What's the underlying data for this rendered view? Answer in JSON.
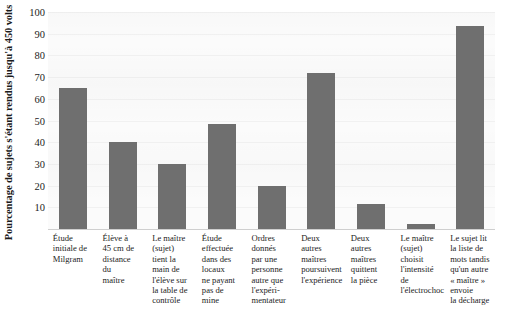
{
  "chart_data": {
    "type": "bar",
    "title": "",
    "subtitle": "",
    "xlabel": "",
    "ylabel": "Pourcentage de sujets s'étant rendus jusqu'à 450 volts",
    "ylim": [
      0,
      100
    ],
    "yticks": [
      10,
      20,
      30,
      40,
      50,
      60,
      70,
      80,
      90,
      100
    ],
    "grid": "horizontal",
    "legend": "none",
    "bar_color": "#6f6f6f",
    "plot_background": "#fbfbfb",
    "categories": [
      "Étude initiale de Milgram",
      "Élève à 45 cm de distance du maître",
      "Le maître (sujet) tient la main de l'élève sur la table de contrôle",
      "Étude effectuée dans des locaux ne payant pas de mine",
      "Ordres donnés par une personne autre que l'expérimentateur",
      "Deux autres maîtres poursuivent l'expérience",
      "Deux autres maîtres quittent la pièce",
      "Le maître (sujet) choisit l'intensité de l'électrochoc",
      "Le sujet lit la liste de mots tandis qu'un autre « maître » envoie la décharge"
    ],
    "values": [
      65,
      40,
      30,
      48.5,
      20,
      72,
      11.5,
      2.5,
      93.5
    ]
  },
  "category_lines": [
    [
      "Étude",
      "initiale de",
      "Milgram"
    ],
    [
      "Élève à",
      "45 cm de",
      "distance",
      "du",
      "maître"
    ],
    [
      "Le maître",
      "(sujet)",
      "tient la",
      "main de",
      "l'élève sur",
      "la table de",
      "contrôle"
    ],
    [
      "Étude",
      "effectuée",
      "dans des",
      "locaux",
      "ne payant",
      "pas de",
      "mine"
    ],
    [
      "Ordres",
      "donnés",
      "par une",
      "personne",
      "autre que",
      "l'expéri-",
      "mentateur"
    ],
    [
      "Deux",
      "autres",
      "maîtres",
      "poursuivent",
      "l'expérience"
    ],
    [
      "Deux",
      "autres",
      "maîtres",
      "quittent",
      "la pièce"
    ],
    [
      "Le maître",
      "(sujet)",
      "choisit",
      "l'intensité",
      "de",
      "l'électrochoc"
    ],
    [
      "Le sujet lit",
      "la liste de",
      "mots tandis",
      "qu'un autre",
      "« maître »",
      "envoie",
      "la décharge"
    ]
  ]
}
